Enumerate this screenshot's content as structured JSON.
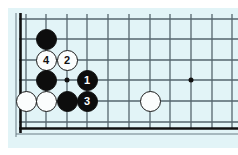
{
  "diagram": {
    "type": "go-board-joseki-diagram",
    "title": "",
    "board_region": "lower-left corner",
    "colors": {
      "board_background": "#e2f4f7",
      "page_background": "#ffffff",
      "grid_line": "#55666e",
      "edge_line": "#111111",
      "black_stone": "#0d0d0d",
      "white_stone": "#fbfdfd",
      "white_stone_outline": "#1a1a1a",
      "star_point": "#111111"
    },
    "geometry": {
      "vertical_lines_x": [
        26,
        46,
        67,
        87,
        108,
        129,
        150,
        170,
        191,
        212,
        232
      ],
      "horizontal_lines_y": [
        19,
        39,
        60,
        80,
        101,
        122
      ],
      "left_edge_x": 19,
      "bottom_edge_y": 128,
      "stone_radius": 10.5,
      "grid_spacing": 20.6
    },
    "star_points": [
      {
        "x": 67,
        "y": 80
      },
      {
        "x": 191,
        "y": 80
      }
    ],
    "stones": [
      {
        "id": "b-upper",
        "color": "black",
        "x": 46,
        "y": 39,
        "label": ""
      },
      {
        "id": "w-move-4",
        "color": "white",
        "x": 46,
        "y": 60,
        "label": "4"
      },
      {
        "id": "w-move-2",
        "color": "white",
        "x": 67,
        "y": 60,
        "label": "2"
      },
      {
        "id": "b-left",
        "color": "black",
        "x": 46,
        "y": 80,
        "label": ""
      },
      {
        "id": "b-move-1",
        "color": "black",
        "x": 87,
        "y": 80,
        "label": "1"
      },
      {
        "id": "w-corner-a",
        "color": "white",
        "x": 26,
        "y": 101,
        "label": ""
      },
      {
        "id": "w-corner-b",
        "color": "white",
        "x": 46,
        "y": 101,
        "label": ""
      },
      {
        "id": "b-lower",
        "color": "black",
        "x": 67,
        "y": 101,
        "label": ""
      },
      {
        "id": "b-move-3",
        "color": "black",
        "x": 87,
        "y": 101,
        "label": "3"
      },
      {
        "id": "w-right",
        "color": "white",
        "x": 150,
        "y": 101,
        "label": ""
      }
    ],
    "move_sequence": [
      {
        "number": "1",
        "color": "black"
      },
      {
        "number": "2",
        "color": "white"
      },
      {
        "number": "3",
        "color": "black"
      },
      {
        "number": "4",
        "color": "white"
      }
    ]
  }
}
